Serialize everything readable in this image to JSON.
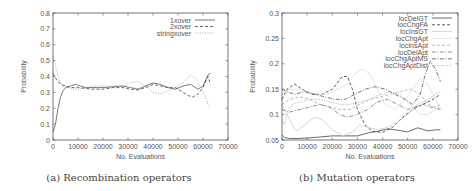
{
  "chart_data": [
    {
      "id": "a",
      "type": "line",
      "caption": "(a) Recombination operators",
      "xlabel": "No. Evaluations",
      "ylabel": "Probability",
      "xlim": [
        0,
        70000
      ],
      "ylim": [
        0,
        0.8
      ],
      "xticks": [
        "0",
        "10000",
        "20000",
        "30000",
        "40000",
        "50000",
        "60000",
        "70000"
      ],
      "yticks": [
        "0",
        "0.1",
        "0.2",
        "0.3",
        "0.4",
        "0.5",
        "0.6",
        "0.7",
        "0.8"
      ],
      "grid": false,
      "legend_position": "top-right",
      "series": [
        {
          "name": "1xover",
          "style": "solid",
          "color": "#555555",
          "x": [
            0,
            1000,
            2000,
            3000,
            4000,
            5000,
            7000,
            9000,
            11000,
            13000,
            16000,
            20000,
            24000,
            28000,
            31000,
            34000,
            37000,
            40000,
            43000,
            46000,
            49000,
            52000,
            55000,
            58000,
            60000,
            62000,
            63000
          ],
          "y": [
            0.05,
            0.1,
            0.2,
            0.27,
            0.31,
            0.33,
            0.34,
            0.35,
            0.34,
            0.33,
            0.33,
            0.33,
            0.335,
            0.34,
            0.33,
            0.32,
            0.34,
            0.36,
            0.35,
            0.33,
            0.32,
            0.34,
            0.35,
            0.32,
            0.34,
            0.41,
            0.42
          ]
        },
        {
          "name": "2xover",
          "style": "dashed",
          "color": "#444444",
          "x": [
            0,
            1000,
            2000,
            3000,
            5000,
            7000,
            10000,
            13000,
            16000,
            20000,
            24000,
            28000,
            31000,
            34000,
            37000,
            40000,
            43000,
            46000,
            49000,
            52000,
            54000,
            56000,
            58000,
            60000,
            62000,
            63000
          ],
          "y": [
            0.42,
            0.39,
            0.37,
            0.35,
            0.34,
            0.33,
            0.33,
            0.325,
            0.32,
            0.32,
            0.33,
            0.33,
            0.32,
            0.315,
            0.33,
            0.35,
            0.34,
            0.33,
            0.33,
            0.3,
            0.28,
            0.27,
            0.29,
            0.33,
            0.4,
            0.35
          ]
        },
        {
          "name": "stringxover",
          "style": "dotted",
          "color": "#999999",
          "x": [
            0,
            500,
            1000,
            2000,
            3000,
            4000,
            6000,
            8000,
            10000,
            13000,
            16000,
            20000,
            24000,
            28000,
            31000,
            34000,
            37000,
            40000,
            43000,
            46000,
            49000,
            52000,
            55000,
            57000,
            59000,
            61000,
            62000,
            63000
          ],
          "y": [
            0.53,
            0.5,
            0.47,
            0.4,
            0.36,
            0.34,
            0.33,
            0.32,
            0.32,
            0.33,
            0.34,
            0.34,
            0.34,
            0.34,
            0.36,
            0.37,
            0.34,
            0.3,
            0.29,
            0.31,
            0.33,
            0.36,
            0.41,
            0.39,
            0.33,
            0.28,
            0.22,
            0.21
          ]
        }
      ]
    },
    {
      "id": "b",
      "type": "line",
      "caption": "(b) Mutation operators",
      "xlabel": "No. Evaluations",
      "ylabel": "Probability",
      "xlim": [
        0,
        70000
      ],
      "ylim": [
        0.05,
        0.3
      ],
      "xticks": [
        "0",
        "10000",
        "20000",
        "30000",
        "40000",
        "50000",
        "60000",
        "70000"
      ],
      "yticks": [
        "0.05",
        "0.1",
        "0.15",
        "0.2",
        "0.25",
        "0.3"
      ],
      "grid": false,
      "legend_position": "top-right",
      "series": [
        {
          "name": "locDelGT",
          "style": "solid",
          "color": "#444444",
          "x": [
            0,
            1000,
            3000,
            6000,
            10000,
            15000,
            20000,
            25000,
            30000,
            35000,
            38000,
            42000,
            45000,
            50000,
            54000,
            58000,
            61000,
            63000
          ],
          "y": [
            0.06,
            0.055,
            0.053,
            0.053,
            0.054,
            0.056,
            0.058,
            0.058,
            0.058,
            0.065,
            0.067,
            0.072,
            0.07,
            0.066,
            0.074,
            0.068,
            0.07,
            0.07
          ]
        },
        {
          "name": "locChgFA",
          "style": "dashed",
          "color": "#333333",
          "x": [
            0,
            2000,
            5000,
            8000,
            12000,
            16000,
            20000,
            24000,
            26000,
            28000,
            30000,
            33000,
            36000,
            40000,
            44000,
            48000,
            52000,
            56000,
            60000,
            63000
          ],
          "y": [
            0.13,
            0.15,
            0.16,
            0.15,
            0.14,
            0.14,
            0.15,
            0.175,
            0.175,
            0.15,
            0.11,
            0.08,
            0.067,
            0.065,
            0.075,
            0.095,
            0.11,
            0.12,
            0.13,
            0.14
          ]
        },
        {
          "name": "locInsGT",
          "style": "solid",
          "color": "#cccccc",
          "x": [
            0,
            2000,
            4000,
            6000,
            9000,
            13000,
            16000,
            20000,
            24000,
            28000,
            31000,
            34000,
            38000,
            42000,
            46000,
            50000,
            54000,
            58000,
            61000,
            63000
          ],
          "y": [
            0.12,
            0.1,
            0.08,
            0.068,
            0.08,
            0.095,
            0.09,
            0.07,
            0.058,
            0.065,
            0.08,
            0.075,
            0.07,
            0.075,
            0.085,
            0.1,
            0.12,
            0.13,
            0.14,
            0.145
          ]
        },
        {
          "name": "locChgApt",
          "style": "solid",
          "color": "#dddddd",
          "x": [
            0,
            3000,
            6000,
            10000,
            14000,
            18000,
            22000,
            26000,
            29000,
            32000,
            35000,
            38000,
            41000,
            45000,
            49000,
            52000,
            55000,
            58000,
            61000,
            63000
          ],
          "y": [
            0.14,
            0.15,
            0.15,
            0.145,
            0.14,
            0.14,
            0.15,
            0.16,
            0.18,
            0.19,
            0.18,
            0.15,
            0.12,
            0.11,
            0.13,
            0.15,
            0.17,
            0.16,
            0.13,
            0.11
          ]
        },
        {
          "name": "locInsApt",
          "style": "dashed",
          "color": "#aaaaaa",
          "x": [
            0,
            3000,
            7000,
            11000,
            15000,
            19000,
            23000,
            27000,
            31000,
            35000,
            39000,
            43000,
            47000,
            51000,
            55000,
            58000,
            61000,
            63000
          ],
          "y": [
            0.12,
            0.13,
            0.135,
            0.13,
            0.12,
            0.115,
            0.11,
            0.11,
            0.12,
            0.13,
            0.135,
            0.14,
            0.145,
            0.15,
            0.14,
            0.12,
            0.115,
            0.12
          ]
        },
        {
          "name": "locDelApt",
          "style": "dash-dot",
          "color": "#777777",
          "x": [
            0,
            3000,
            7000,
            11000,
            15000,
            19000,
            23000,
            26000,
            30000,
            34000,
            38000,
            42000,
            46000,
            50000,
            53000,
            56000,
            59000,
            63000
          ],
          "y": [
            0.11,
            0.105,
            0.11,
            0.115,
            0.12,
            0.115,
            0.1,
            0.095,
            0.1,
            0.11,
            0.125,
            0.13,
            0.12,
            0.11,
            0.115,
            0.12,
            0.115,
            0.11
          ]
        },
        {
          "name": "locChgAptMS",
          "style": "dash-dot",
          "color": "#555555",
          "x": [
            0,
            2000,
            5000,
            9000,
            13000,
            17000,
            21000,
            25000,
            29000,
            33000,
            37000,
            41000,
            45000,
            49000,
            52000,
            55000,
            57000,
            59000,
            61000,
            63000
          ],
          "y": [
            0.15,
            0.145,
            0.14,
            0.145,
            0.14,
            0.135,
            0.13,
            0.13,
            0.14,
            0.15,
            0.155,
            0.15,
            0.14,
            0.13,
            0.12,
            0.14,
            0.18,
            0.205,
            0.19,
            0.165
          ]
        },
        {
          "name": "locChgAptDist",
          "style": "dotted",
          "color": "#999999",
          "x": [
            0,
            1000,
            2000,
            4000,
            7000,
            11000,
            15000,
            19000,
            23000,
            27000,
            31000,
            35000,
            39000,
            43000,
            47000,
            51000,
            55000,
            58000,
            61000,
            63000
          ],
          "y": [
            0.09,
            0.08,
            0.1,
            0.12,
            0.125,
            0.13,
            0.13,
            0.125,
            0.12,
            0.12,
            0.125,
            0.13,
            0.14,
            0.145,
            0.14,
            0.12,
            0.1,
            0.1,
            0.11,
            0.115
          ]
        }
      ]
    }
  ]
}
